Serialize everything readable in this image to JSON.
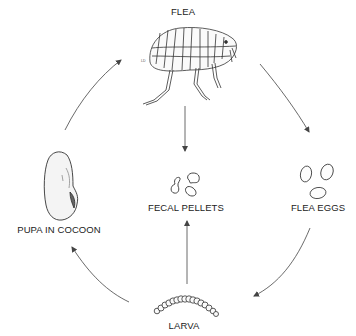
{
  "diagram": {
    "stages": [
      {
        "id": "flea",
        "label": "FLEA"
      },
      {
        "id": "eggs",
        "label": "FLEA EGGS"
      },
      {
        "id": "larva",
        "label": "LARVA"
      },
      {
        "id": "pupa",
        "label": "PUPA IN COCOON"
      },
      {
        "id": "pellets",
        "label": "FECAL PELLETS"
      }
    ],
    "arrows": [
      {
        "from": "flea",
        "to": "eggs"
      },
      {
        "from": "eggs",
        "to": "larva"
      },
      {
        "from": "larva",
        "to": "pupa"
      },
      {
        "from": "pupa",
        "to": "flea"
      },
      {
        "from": "flea",
        "to": "pellets"
      },
      {
        "from": "larva",
        "to": "pellets"
      }
    ],
    "colors": {
      "line": "#444444",
      "text": "#222222",
      "background": "#ffffff"
    }
  }
}
